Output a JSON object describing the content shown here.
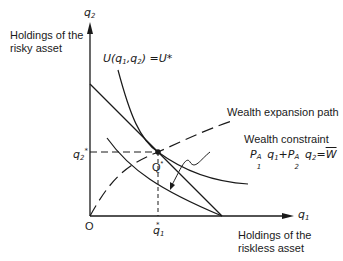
{
  "figure": {
    "y_axis": {
      "symbol": "q",
      "subscript": "2",
      "label_line1": "Holdings of the",
      "label_line2": "risky asset"
    },
    "x_axis": {
      "symbol": "q",
      "subscript": "1",
      "label_line1": "Holdings of the",
      "label_line2": "riskless asset"
    },
    "origin_label": "O",
    "indifference_curve_label": {
      "text_prefix": "U(q",
      "s1": "1",
      "mid": ",q",
      "s2": "2",
      "suffix": ") =U*"
    },
    "wealth_expansion_path_label": "Wealth expansion path",
    "wealth_constraint": {
      "title": "Wealth constraint",
      "p": "P",
      "sup": "A",
      "s1": "1",
      "q": "q",
      "s2": "2",
      "plus": "+",
      "eq": "=",
      "w": "W"
    },
    "optimum": {
      "label": "Q",
      "star": "*"
    },
    "q2_star": {
      "symbol": "q",
      "sub": "2",
      "star": "*"
    },
    "q1_star": {
      "symbol": "q",
      "sub": "1",
      "star": "*"
    }
  }
}
